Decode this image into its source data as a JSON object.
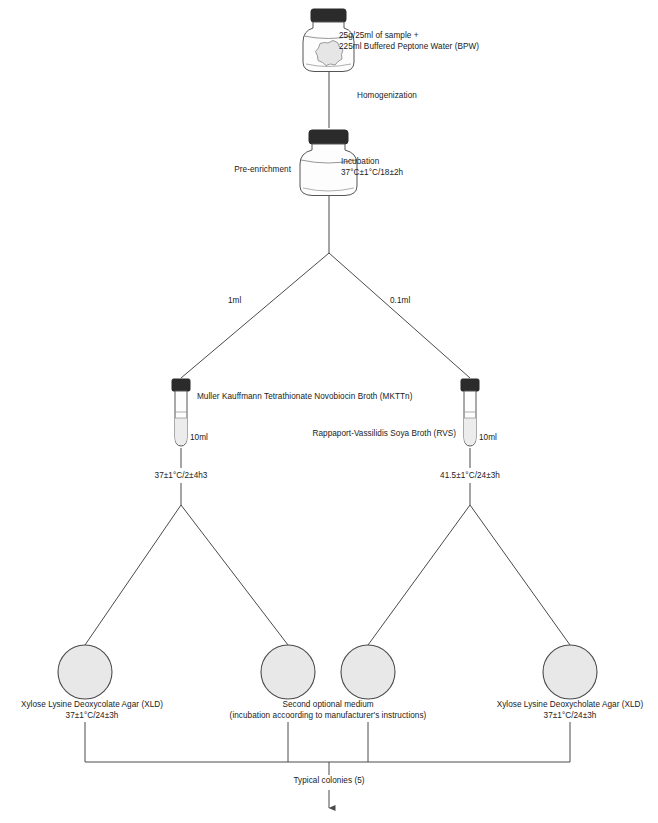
{
  "diagram": {
    "colors": {
      "line": "#4a4a4a",
      "cap": "#2b2b2b",
      "glass_stroke": "#555555",
      "liquid": "#ececec",
      "plate_fill": "#e8e8e8",
      "plate_stroke": "#4a4a4a",
      "text": "#1a1a1a"
    },
    "steps": {
      "sample": {
        "line1": "25g/25ml of sample +",
        "line2": "225ml Buffered Peptone Water (BPW)"
      },
      "homogenization": "Homogenization",
      "pre_enrichment": "Pre-enrichment",
      "incubation": {
        "line1": "Incubation",
        "line2": "37°C±1°C/18±2h"
      },
      "volume_left": "1ml",
      "volume_right": "0.1ml",
      "mkttn": {
        "name": "Muller Kauffmann Tetrathionate Novobiocin Broth (MKTTn)",
        "volume": "10ml",
        "incubation": "37±1°C/2±4h3"
      },
      "rvs": {
        "name": "Rappaport-Vassilidis Soya Broth (RVS)",
        "volume": "10ml",
        "incubation": "41.5±1°C/24±3h"
      },
      "plates": [
        {
          "line1": "Xylose Lysine Deoxycolate Agar (XLD)",
          "line2": "37±1°C/24±3h"
        },
        {
          "line1": "Second optional medium",
          "line2": "(incubation accoording to manufacturer's instructions)"
        },
        {
          "line1": "Second optional medium",
          "line2": "(incubation accoording to manufacturer's instructions)"
        },
        {
          "line1": "Xylose Lysine Deoxycholate Agar (XLD)",
          "line2": "37±1°C/24±3h"
        }
      ],
      "typical_colonies": "Typical colonies (5)"
    }
  }
}
